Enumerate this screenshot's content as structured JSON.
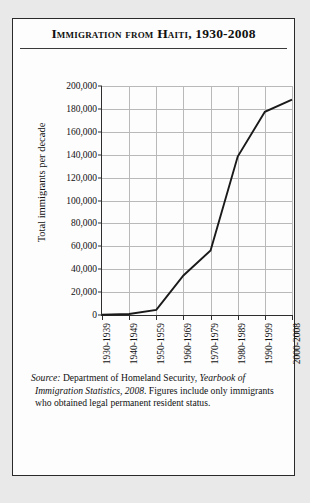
{
  "figure": {
    "title": "Immigration from Haiti, 1930-2008",
    "source_prefix": "Source:",
    "source_text_1": " Department of Homeland Security, ",
    "source_italic": "Yearbook of Immigration Statistics, 2008",
    "source_text_2": ". Figures include only immigrants who obtained legal permanent resident status."
  },
  "chart_data": {
    "type": "line",
    "title": "Immigration from Haiti, 1930-2008",
    "xlabel": "",
    "ylabel": "Total immigrants per decade",
    "categories": [
      "1930-1939",
      "1940-1949",
      "1950-1959",
      "1960-1969",
      "1970-1979",
      "1980-1989",
      "1990-1999",
      "2000-2008"
    ],
    "values": [
      191,
      911,
      4442,
      34499,
      56335,
      138379,
      177446,
      188000
    ],
    "ylim": [
      0,
      200000
    ],
    "ytick_values": [
      0,
      20000,
      40000,
      60000,
      80000,
      100000,
      120000,
      140000,
      160000,
      180000,
      200000
    ],
    "ytick_labels": [
      "0",
      "20,000",
      "40,000",
      "60,000",
      "80,000",
      "100,000",
      "120,000",
      "140,000",
      "160,000",
      "180,000",
      "200,000"
    ],
    "grid": true,
    "legend": false,
    "line_color": "#1a1a1a",
    "grid_color": "#b9b9b9",
    "axis_color": "#2e2e2e"
  }
}
